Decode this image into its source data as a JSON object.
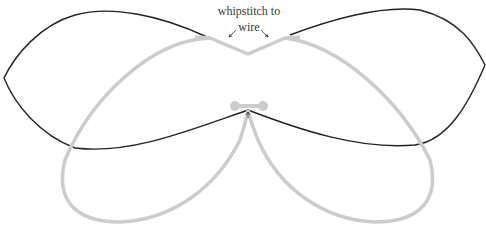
{
  "annotation": {
    "line1": "whipstitch to",
    "line2": "wire"
  },
  "colors": {
    "outline": "#222222",
    "wire": "#cccccc",
    "background": "#ffffff",
    "text": "#3a3a3a"
  }
}
